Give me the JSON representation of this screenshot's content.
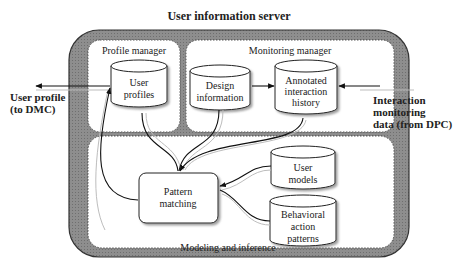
{
  "title": "User information server",
  "panels": {
    "profile_manager": "Profile manager",
    "monitoring_manager": "Monitoring manager",
    "modeling_inference": "Modeling and inference"
  },
  "stores": {
    "user_profiles": [
      "User",
      "profiles"
    ],
    "design_information": [
      "Design",
      "information"
    ],
    "annotated_history": [
      "Annotated",
      "interaction",
      "history"
    ],
    "user_models": [
      "User",
      "models"
    ],
    "behavioral_patterns": [
      "Behavioral",
      "action",
      "patterns"
    ]
  },
  "process": {
    "pattern_matching": [
      "Pattern",
      "matching"
    ]
  },
  "external": {
    "output": [
      "User profile",
      "(to DMC)"
    ],
    "input": [
      "Interaction",
      "monitoring",
      "data (from DPC)"
    ]
  },
  "colors": {
    "server_fill": "#8a8a8a",
    "panel_fill": "#ffffff",
    "line": "#222222",
    "ghost_line": "#bdbdbd"
  }
}
